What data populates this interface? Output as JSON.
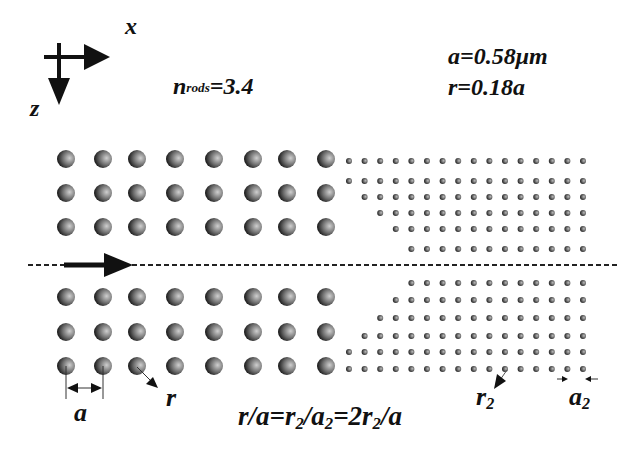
{
  "axes": {
    "x_label": "x",
    "z_label": "z"
  },
  "parameters": {
    "n_rods": {
      "symbol": "n",
      "subscript": "rods",
      "value": "=3.4"
    },
    "lattice_constant": "a=0.58μm",
    "radius": "r=0.18a"
  },
  "annotations": {
    "a_label": "a",
    "r_label": "r",
    "r2_label": {
      "symbol": "r",
      "subscript": "2"
    },
    "a2_label": {
      "symbol": "a",
      "subscript": "2"
    },
    "relation": {
      "p1": "r/a=r",
      "s1": "2",
      "p2": "/a",
      "s2": "2",
      "p3": "=2r",
      "s3": "2",
      "p4": "/a"
    }
  },
  "colors": {
    "rod_dark": "#1a1a1a",
    "rod_light": "#c8c8c8",
    "line": "#111111",
    "background": "#ffffff"
  },
  "structure": {
    "large_rods": {
      "columns_x": [
        66,
        103,
        137,
        175,
        214,
        253,
        287,
        326
      ],
      "rows_y": [
        159,
        193,
        227,
        297,
        332,
        366
      ],
      "radius": 9
    },
    "small_rods": {
      "spacing": 15.6,
      "radius": 3,
      "start_x": 349,
      "end_x": 585,
      "upper_rows": [
        {
          "y": 161,
          "start_col": 0
        },
        {
          "y": 181,
          "start_col": 0
        },
        {
          "y": 197,
          "start_col": 1
        },
        {
          "y": 213,
          "start_col": 2
        },
        {
          "y": 229,
          "start_col": 3
        },
        {
          "y": 249,
          "start_col": 4
        }
      ],
      "lower_rows": [
        {
          "y": 283,
          "start_col": 4
        },
        {
          "y": 300,
          "start_col": 3
        },
        {
          "y": 318,
          "start_col": 2
        },
        {
          "y": 336,
          "start_col": 1
        },
        {
          "y": 352,
          "start_col": 0
        },
        {
          "y": 369,
          "start_col": 0
        }
      ]
    },
    "waveguide_axis_y": 265
  }
}
